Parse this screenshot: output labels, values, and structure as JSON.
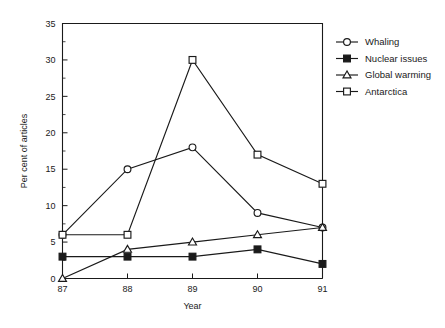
{
  "chart_data": {
    "type": "line",
    "title": "",
    "xlabel": "Year",
    "ylabel": "Per cent of articles",
    "categories": [
      "87",
      "88",
      "89",
      "90",
      "91"
    ],
    "x": [
      87,
      88,
      89,
      90,
      91
    ],
    "xlim": [
      87,
      91
    ],
    "ylim": [
      0,
      35
    ],
    "yticks": [
      0,
      5,
      10,
      15,
      20,
      25,
      30,
      35
    ],
    "ytick_labels": [
      "0",
      "5",
      "10",
      "15",
      "20",
      "25",
      "30",
      "35"
    ],
    "ytick_minor_step": 2.5,
    "xtick_labels": [
      "87",
      "88",
      "89",
      "90",
      "91"
    ],
    "grid": false,
    "legend_position": "right",
    "series": [
      {
        "name": "Whaling",
        "marker": "open-circle",
        "values": [
          6,
          15,
          18,
          9,
          7
        ]
      },
      {
        "name": "Nuclear issues",
        "marker": "filled-square",
        "values": [
          3,
          3,
          3,
          4,
          2
        ]
      },
      {
        "name": "Global warming",
        "marker": "open-triangle",
        "values": [
          0,
          4,
          5,
          6,
          7
        ]
      },
      {
        "name": "Antarctica",
        "marker": "open-square",
        "values": [
          6,
          6,
          30,
          17,
          13
        ]
      }
    ],
    "colors": {
      "line": "#1a1a1a",
      "marker_fill_open": "#ffffff",
      "marker_fill_solid": "#1a1a1a",
      "background": "#ffffff"
    }
  }
}
